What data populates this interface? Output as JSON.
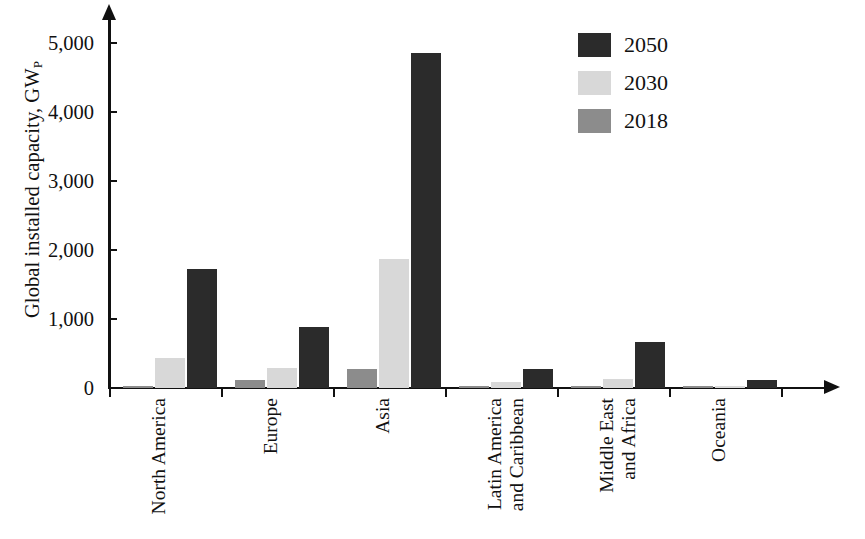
{
  "chart_data": {
    "type": "bar",
    "title": "",
    "subtitle": "",
    "xlabel": "",
    "ylabel": "Global installed capacity, GW",
    "ylabel_subscript": "P",
    "orientation": "vertical",
    "grouped": true,
    "grid": false,
    "legend_position": "top-right",
    "ylim": [
      0,
      5400
    ],
    "yticks": [
      0,
      1000,
      2000,
      3000,
      4000,
      5000
    ],
    "ytick_labels": [
      "0",
      "1,000",
      "2,000",
      "3,000",
      "4,000",
      "5,000"
    ],
    "categories": [
      "North America",
      "Europe",
      "Asia",
      "Latin America and Caribbean",
      "Middle East and Africa",
      "Oceania"
    ],
    "category_label_lines": [
      [
        "North America"
      ],
      [
        "Europe"
      ],
      [
        "Asia"
      ],
      [
        "Latin America",
        "and Caribbean"
      ],
      [
        "Middle East",
        "and Africa"
      ],
      [
        "Oceania"
      ]
    ],
    "series": [
      {
        "name": "2018",
        "color": "#8c8c8c",
        "values": [
          35,
          120,
          270,
          10,
          10,
          5
        ]
      },
      {
        "name": "2030",
        "color": "#d8d8d8",
        "values": [
          440,
          290,
          1870,
          90,
          130,
          15
        ]
      },
      {
        "name": "2050",
        "color": "#2b2b2b",
        "values": [
          1730,
          880,
          4855,
          280,
          660,
          110
        ]
      }
    ],
    "series_draw_order": [
      "2018",
      "2030",
      "2050"
    ]
  },
  "legend": {
    "entries": [
      {
        "label": "2050",
        "color": "#2b2b2b"
      },
      {
        "label": "2030",
        "color": "#d8d8d8"
      },
      {
        "label": "2018",
        "color": "#8c8c8c"
      }
    ]
  },
  "axes": {
    "y_title_text": "Global installed capacity, GW",
    "y_title_sub": "P"
  }
}
